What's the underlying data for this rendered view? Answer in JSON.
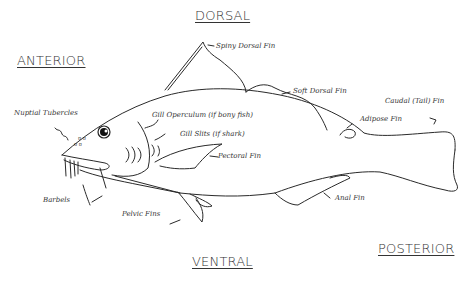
{
  "directions": {
    "dorsal": "DORSAL",
    "anterior": "ANTERIOR",
    "ventral": "VENTRAL",
    "posterior": "POSTERIOR"
  },
  "labels": {
    "spiny_dorsal_fin": "Spiny Dorsal Fin",
    "soft_dorsal_fin": "Soft Dorsal Fin",
    "caudal_fin": "Caudal (Tail) Fin",
    "adipose_fin": "Adipose Fin",
    "nuptial_tubercles": "Nuptial Tubercles",
    "gill_operculum": "Gill Operculum (if bony fish)",
    "gill_slits": "Gill Slits (if shark)",
    "pectoral_fin": "Pectoral Fin",
    "barbels": "Barbels",
    "pelvic_fins": "Pelvic Fins",
    "anal_fin": "Anal Fin"
  }
}
